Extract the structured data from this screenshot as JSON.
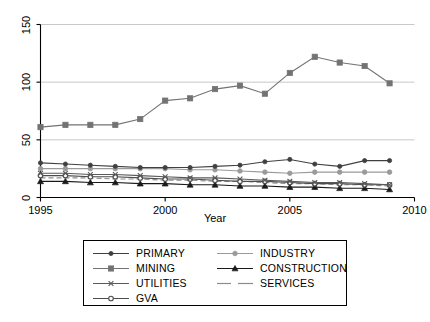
{
  "chart_data": {
    "type": "line",
    "title": "",
    "xlabel": "Year",
    "ylabel": "",
    "xlim": [
      1995,
      2010
    ],
    "ylim": [
      0,
      150
    ],
    "xticks": [
      1995,
      2000,
      2005,
      2010
    ],
    "yticks": [
      0,
      50,
      100,
      150
    ],
    "grid": true,
    "legend_position": "below-center",
    "x": [
      1995,
      1996,
      1997,
      1998,
      1999,
      2000,
      2001,
      2002,
      2003,
      2004,
      2005,
      2006,
      2007,
      2008,
      2009
    ],
    "series": [
      {
        "name": "PRIMARY",
        "marker": "filled-circle",
        "color": "#404040",
        "dash": "solid",
        "values": [
          30,
          29,
          28,
          27,
          26,
          26,
          26,
          27,
          28,
          31,
          33,
          29,
          27,
          32,
          32
        ]
      },
      {
        "name": "INDUSTRY",
        "marker": "light-circle",
        "color": "#9a9a9a",
        "dash": "solid",
        "values": [
          25,
          25,
          25,
          25,
          25,
          25,
          24,
          24,
          23,
          22,
          21,
          22,
          22,
          22,
          22
        ]
      },
      {
        "name": "MINING",
        "marker": "filled-square",
        "color": "#737373",
        "dash": "solid",
        "values": [
          61,
          63,
          63,
          63,
          68,
          84,
          86,
          94,
          97,
          90,
          108,
          122,
          117,
          114,
          99
        ]
      },
      {
        "name": "CONSTRUCTION",
        "marker": "triangle",
        "color": "#1a1a1a",
        "dash": "solid",
        "values": [
          14,
          14,
          13,
          13,
          12,
          12,
          11,
          11,
          10,
          10,
          9,
          9,
          8,
          8,
          7
        ]
      },
      {
        "name": "UTILITIES",
        "marker": "cross",
        "color": "#595959",
        "dash": "solid",
        "values": [
          21,
          21,
          20,
          20,
          19,
          18,
          17,
          17,
          16,
          15,
          14,
          13,
          13,
          12,
          11
        ]
      },
      {
        "name": "SERVICES",
        "marker": "none",
        "color": "#8c8c8c",
        "dash": "dashed",
        "values": [
          17,
          17,
          17,
          16,
          16,
          15,
          15,
          14,
          14,
          13,
          12,
          12,
          11,
          11,
          10
        ]
      },
      {
        "name": "GVA",
        "marker": "open-circle",
        "color": "#4d4d4d",
        "dash": "solid",
        "values": [
          19,
          19,
          18,
          18,
          17,
          16,
          16,
          15,
          14,
          14,
          13,
          12,
          12,
          11,
          11
        ]
      }
    ]
  },
  "axis": {
    "x_title": "Year",
    "x_tick_labels": [
      "1995",
      "2000",
      "2005",
      "2010"
    ],
    "y_tick_labels": [
      "0",
      "50",
      "100",
      "150"
    ]
  },
  "legend": {
    "entries": [
      {
        "label": "PRIMARY"
      },
      {
        "label": "INDUSTRY"
      },
      {
        "label": "MINING"
      },
      {
        "label": "CONSTRUCTION"
      },
      {
        "label": "UTILITIES"
      },
      {
        "label": "SERVICES"
      },
      {
        "label": "GVA"
      }
    ]
  },
  "style": {
    "background": "#ffffff",
    "grid_color": "#c8c8c8",
    "axis_color": "#000000"
  }
}
